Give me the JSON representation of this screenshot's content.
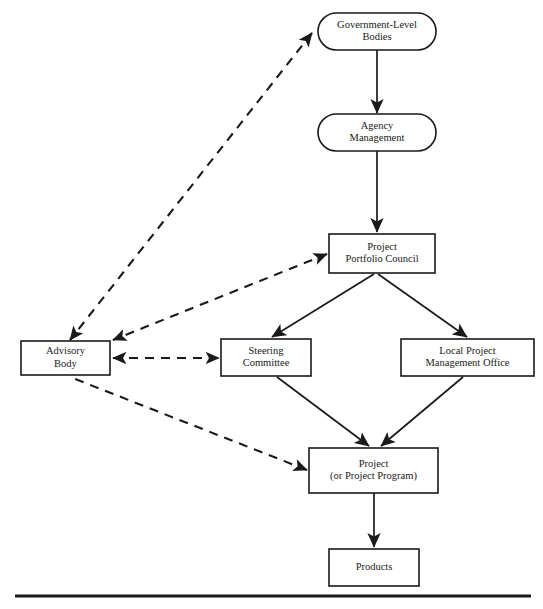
{
  "diagram": {
    "nodes": [
      {
        "id": "government_level_bodies",
        "shape": "rounded",
        "lines": [
          "Government-Level",
          "Bodies"
        ],
        "x": 318,
        "y": 13,
        "w": 118,
        "h": 37
      },
      {
        "id": "agency_management",
        "shape": "rounded",
        "lines": [
          "Agency",
          "Management"
        ],
        "x": 318,
        "y": 114,
        "w": 118,
        "h": 37
      },
      {
        "id": "project_portfolio_council",
        "shape": "rectangle",
        "lines": [
          "Project",
          "Portfolio Council"
        ],
        "x": 329,
        "y": 234,
        "w": 106,
        "h": 39
      },
      {
        "id": "advisory_body",
        "shape": "rectangle",
        "lines": [
          "Advisory",
          "Body"
        ],
        "x": 21,
        "y": 341,
        "w": 89,
        "h": 34
      },
      {
        "id": "steering_committee",
        "shape": "rectangle",
        "lines": [
          "Steering",
          "Committee"
        ],
        "x": 221,
        "y": 339,
        "w": 90,
        "h": 37
      },
      {
        "id": "local_project_management_office",
        "shape": "rectangle",
        "lines": [
          "Local Project",
          "Management Office"
        ],
        "x": 401,
        "y": 339,
        "w": 133,
        "h": 37
      },
      {
        "id": "project",
        "shape": "rectangle",
        "lines": [
          "Project",
          "(or Project Program)"
        ],
        "x": 309,
        "y": 448,
        "w": 129,
        "h": 45
      },
      {
        "id": "products",
        "shape": "rectangle",
        "lines": [
          "Products"
        ],
        "x": 329,
        "y": 549,
        "w": 90,
        "h": 37
      }
    ],
    "edges": [
      {
        "id": "gov-to-agency",
        "from": "government_level_bodies",
        "to": "agency_management",
        "style": "solid",
        "arrows": "end",
        "path": "M 377 50 L 377 113"
      },
      {
        "id": "agency-to-ppc",
        "from": "agency_management",
        "to": "project_portfolio_council",
        "style": "solid",
        "arrows": "end",
        "path": "M 377 151 L 377 232"
      },
      {
        "id": "ppc-to-steering",
        "from": "project_portfolio_council",
        "to": "steering_committee",
        "style": "solid",
        "arrows": "end",
        "path": "M 374 274 L 272 337"
      },
      {
        "id": "ppc-to-lpmo",
        "from": "project_portfolio_council",
        "to": "local_project_management_office",
        "style": "solid",
        "arrows": "end",
        "path": "M 378 274 L 467 337"
      },
      {
        "id": "steering-to-project",
        "from": "steering_committee",
        "to": "project",
        "style": "solid",
        "arrows": "end",
        "path": "M 277 377 L 369 446"
      },
      {
        "id": "lpmo-to-project",
        "from": "local_project_management_office",
        "to": "project",
        "style": "solid",
        "arrows": "end",
        "path": "M 463 377 L 381 446"
      },
      {
        "id": "project-to-products",
        "from": "project",
        "to": "products",
        "style": "solid",
        "arrows": "end",
        "path": "M 374 493 L 374 547"
      },
      {
        "id": "gov-advisory",
        "from": "government_level_bodies",
        "to": "advisory_body",
        "style": "dashed",
        "arrows": "both",
        "path": "M 312 33 L 70 340"
      },
      {
        "id": "ppc-advisory",
        "from": "project_portfolio_council",
        "to": "advisory_body",
        "style": "dashed",
        "arrows": "both",
        "path": "M 327 254 L 113 340"
      },
      {
        "id": "advisory-steering",
        "from": "advisory_body",
        "to": "steering_committee",
        "style": "dashed",
        "arrows": "both",
        "path": "M 113 358 L 219 358"
      },
      {
        "id": "project-advisory",
        "from": "project",
        "to": "advisory_body",
        "style": "dashed",
        "arrows": "start",
        "path": "M 307 470 L 70 377"
      }
    ],
    "footer_rule": {
      "id": "bottom-rule",
      "x1": 15,
      "y1": 596,
      "x2": 531,
      "y2": 596
    }
  },
  "colors": {
    "ink": "#1a1a1a",
    "background": "#ffffff"
  }
}
